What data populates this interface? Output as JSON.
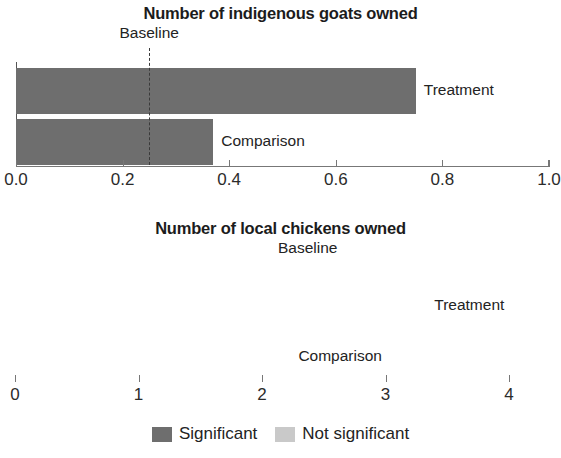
{
  "chart_data": [
    {
      "type": "bar",
      "orientation": "horizontal",
      "title": "Number of indigenous goats owned",
      "xlabel": "",
      "ylabel": "",
      "categories": [
        "Treatment",
        "Comparison"
      ],
      "values": [
        0.75,
        0.37
      ],
      "bar_significance": [
        "Significant",
        "Significant"
      ],
      "xlim": [
        0.0,
        1.0
      ],
      "xticks": [
        0.0,
        0.2,
        0.4,
        0.6,
        0.8,
        1.0
      ],
      "xtick_labels": [
        "0.0",
        "0.2",
        "0.4",
        "0.6",
        "0.8",
        "1.0"
      ],
      "grid": false,
      "annotations": [
        {
          "label": "Baseline",
          "value": 0.25,
          "style": "dashed-vertical-line"
        }
      ]
    },
    {
      "type": "bar",
      "orientation": "horizontal",
      "title": "Number of local chickens owned",
      "xlabel": "",
      "ylabel": "",
      "categories": [
        "Treatment",
        "Comparison"
      ],
      "values": [
        3.33,
        2.23
      ],
      "bar_significance": [
        "Significant",
        "Not significant"
      ],
      "xlim": [
        0,
        4
      ],
      "xticks": [
        0,
        1,
        2,
        3,
        4
      ],
      "xtick_labels": [
        "0",
        "1",
        "2",
        "3",
        "4"
      ],
      "grid": false,
      "annotations": [
        {
          "label": "Baseline",
          "value": 2.37,
          "style": "dashed-vertical-line"
        }
      ]
    }
  ],
  "legend": {
    "position": "bottom-center",
    "items": [
      {
        "label": "Significant",
        "color": "#6e6e6e",
        "key": "significant"
      },
      {
        "label": "Not significant",
        "color": "#c9c9c9",
        "key": "not-significant"
      }
    ]
  },
  "colors": {
    "significant": "#6e6e6e",
    "not_significant": "#c9c9c9",
    "axis": "#777777",
    "baseline": "#3a3a3a",
    "text": "#232323",
    "background": "#ffffff"
  }
}
